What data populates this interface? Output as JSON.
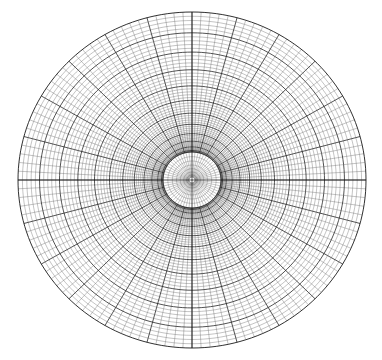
{
  "figure": {
    "type": "mesh-diagram",
    "background_color": "#ffffff",
    "width": 382,
    "height": 360
  },
  "chart_data": {
    "type": "mesh",
    "subtype": "polar-structured-grid",
    "title": "",
    "subtitle": "",
    "xlabel": "",
    "ylabel": "",
    "grid": true,
    "legend": null,
    "annotations": [],
    "geometry": {
      "shape": "ellipse",
      "center_x": 192,
      "center_y": 180,
      "radius_x": 174,
      "radius_y": 168,
      "inner_core_radius_x": 29,
      "inner_core_radius_y": 28
    },
    "topology": {
      "angular_divisions": 120,
      "radial_divisions": 60,
      "angular_block_step": 5,
      "radial_block_step": 5,
      "core_ring_count": 9,
      "core_spoke_count": 60,
      "radial_spacing_law": "geometric-graded",
      "grading_exponent": 1.85
    },
    "axis_lines": {
      "horizontal": true,
      "vertical": true
    },
    "colors": {
      "fine_line": "#555555",
      "block_line": "#1a1a1a",
      "outer_boundary": "#1a1a1a",
      "core_line": "#444444",
      "axis_line": "#111111",
      "background": "#ffffff"
    },
    "stroke_widths": {
      "fine": 0.35,
      "block": 0.75,
      "outer": 0.9,
      "core": 0.3,
      "axis": 0.6
    }
  }
}
